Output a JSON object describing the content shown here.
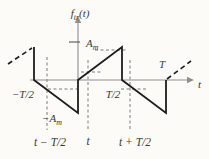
{
  "colors": {
    "background": "#fcfbf8",
    "axis": "#8f8f8f",
    "signal": "#1d1d1d",
    "guide": "#7d7d7d",
    "text": "#3a3a3a"
  },
  "chart_data": {
    "type": "line",
    "waveform": "bipolar sawtooth, period T, amplitude A_m, with sampling instants marked",
    "xlabel": "t",
    "ylabel": "f_tr(t)",
    "x_unit": "multiples of period T",
    "y_unit": "multiples of amplitude A_m",
    "xlim": [
      -0.8,
      1.3
    ],
    "ylim": [
      -1,
      1
    ],
    "solid_segments": [
      [
        [
          -0.5,
          1
        ],
        [
          -0.5,
          0
        ]
      ],
      [
        [
          -0.5,
          0
        ],
        [
          0,
          -1
        ]
      ],
      [
        [
          0,
          -1
        ],
        [
          0,
          0
        ]
      ],
      [
        [
          0,
          0
        ],
        [
          0.5,
          1
        ]
      ],
      [
        [
          0.5,
          1
        ],
        [
          0.5,
          0
        ]
      ],
      [
        [
          0.5,
          0
        ],
        [
          1,
          -1
        ]
      ],
      [
        [
          1,
          -1
        ],
        [
          1,
          0
        ]
      ]
    ],
    "dashed_segments": [
      [
        [
          -0.8,
          0.48
        ],
        [
          -0.52,
          0.97
        ]
      ],
      [
        [
          1.02,
          0.04
        ],
        [
          1.28,
          0.57
        ]
      ]
    ],
    "x_ticks": [
      {
        "label": "−T/2",
        "t": -0.5
      },
      {
        "label": "T/2",
        "t": 0.5
      },
      {
        "label": "T",
        "t": 1
      }
    ],
    "y_ticks": [
      {
        "label": "A_m",
        "f": 1
      },
      {
        "label": "−A_m",
        "f": -1
      }
    ],
    "sample_instants": [
      {
        "label": "t − T/2",
        "t": -0.375,
        "value": -0.25
      },
      {
        "label": "t",
        "t": 0.125,
        "value": 0.25
      },
      {
        "label": "t + T/2",
        "t": 0.625,
        "value": -0.25
      }
    ],
    "legend": null,
    "grid": false
  },
  "figure": {
    "axes": {
      "x": {
        "x1": 30,
        "y1": 80,
        "x2": 188,
        "y2": 80,
        "arrow": [
          [
            187,
            76.8
          ],
          [
            194,
            80
          ],
          [
            187,
            83.2
          ]
        ],
        "name": "x-axis"
      },
      "y": {
        "x1": 78,
        "y1": 80,
        "x2": 78,
        "y2": 22,
        "arrow": [
          [
            74.8,
            23
          ],
          [
            78,
            16
          ],
          [
            81.2,
            23
          ]
        ],
        "name": "y-axis"
      }
    },
    "amplitude_tick": {
      "x1": 69,
      "y1": 42,
      "x2": 80,
      "y2": 42,
      "name": "amplitude-tick"
    },
    "guides": [
      {
        "x1": 47,
        "y1": 57,
        "x2": 47,
        "y2": 130,
        "name": "sampling-guide-t-minus-half"
      },
      {
        "x1": 88,
        "y1": 60,
        "x2": 88,
        "y2": 130,
        "name": "sampling-guide-t"
      },
      {
        "x1": 130,
        "y1": 60,
        "x2": 130,
        "y2": 130,
        "name": "sampling-guide-t-plus-half"
      },
      {
        "x1": 48,
        "y1": 89,
        "x2": 77,
        "y2": 89,
        "name": "value-marker-left"
      },
      {
        "x1": 81,
        "y1": 72,
        "x2": 102,
        "y2": 72,
        "name": "value-marker-center"
      },
      {
        "x1": 121,
        "y1": 89,
        "x2": 146,
        "y2": 89,
        "name": "value-marker-right"
      },
      {
        "x1": 95,
        "y1": 50,
        "x2": 126,
        "y2": 50,
        "name": "peak-level-marker"
      }
    ],
    "signal_solid": [
      [
        34,
        47
      ],
      [
        34,
        80
      ],
      [
        78,
        113
      ],
      [
        78,
        80
      ],
      [
        122,
        47
      ],
      [
        122,
        80
      ],
      [
        166,
        113
      ],
      [
        166,
        80
      ]
    ],
    "signal_dashed": [
      {
        "x1": 8,
        "y1": 64,
        "x2": 32,
        "y2": 48,
        "name": "waveform-continuation-left"
      },
      {
        "x1": 167,
        "y1": 79,
        "x2": 191,
        "y2": 61,
        "name": "waveform-continuation-right"
      }
    ],
    "labels": [
      {
        "name": "y-axis-title",
        "x": 80,
        "y": 17,
        "anchor": "middle",
        "size": 11,
        "runs": [
          {
            "t": "f"
          },
          {
            "t": "tr",
            "sub": true
          },
          {
            "t": "(t)"
          }
        ]
      },
      {
        "name": "amplitude-pos-label",
        "x": 86,
        "y": 47,
        "anchor": "start",
        "size": 11,
        "runs": [
          {
            "t": "A"
          },
          {
            "t": "m",
            "sub": true
          }
        ]
      },
      {
        "name": "amplitude-neg-label",
        "x": 42,
        "y": 122,
        "anchor": "start",
        "size": 11,
        "runs": [
          {
            "t": "−A"
          },
          {
            "t": "m",
            "sub": true
          }
        ]
      },
      {
        "name": "tick-label-neg-half-period",
        "x": 23,
        "y": 98,
        "anchor": "middle",
        "size": 11,
        "runs": [
          {
            "t": "−T/2"
          }
        ]
      },
      {
        "name": "tick-label-pos-half-period",
        "x": 113,
        "y": 98,
        "anchor": "middle",
        "size": 11,
        "runs": [
          {
            "t": "T/2"
          }
        ]
      },
      {
        "name": "tick-label-period",
        "x": 162,
        "y": 68,
        "anchor": "middle",
        "size": 11,
        "runs": [
          {
            "t": "T"
          }
        ]
      },
      {
        "name": "x-axis-title",
        "x": 198,
        "y": 88,
        "anchor": "start",
        "size": 11,
        "runs": [
          {
            "t": "t"
          }
        ]
      },
      {
        "name": "sample-label-left",
        "x": 50,
        "y": 146,
        "anchor": "middle",
        "size": 11.5,
        "runs": [
          {
            "t": "t − T/2"
          }
        ]
      },
      {
        "name": "sample-label-center",
        "x": 88,
        "y": 145,
        "anchor": "middle",
        "size": 11.5,
        "runs": [
          {
            "t": "t"
          }
        ]
      },
      {
        "name": "sample-label-right",
        "x": 135,
        "y": 146,
        "anchor": "middle",
        "size": 11.5,
        "runs": [
          {
            "t": "t + T/2"
          }
        ]
      }
    ]
  }
}
